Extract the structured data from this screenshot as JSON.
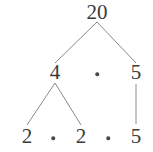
{
  "diagram": {
    "type": "factor-tree",
    "background_color": "#ffffff",
    "line_color": "#8a8a8a",
    "text_color": "#3a3a3a",
    "root_value": "20",
    "levels": [
      {
        "name": "root",
        "nodes": [
          {
            "id": "root-20",
            "label": "20",
            "kind": "number",
            "x": 97,
            "y": 12
          }
        ]
      },
      {
        "name": "level-2",
        "nodes": [
          {
            "id": "mid-4",
            "label": "4",
            "kind": "number",
            "x": 55,
            "y": 72
          },
          {
            "id": "mid-dot-1",
            "label": "·",
            "kind": "operator",
            "x": 97,
            "y": 74
          },
          {
            "id": "mid-5",
            "label": "5",
            "kind": "number",
            "x": 136,
            "y": 72
          }
        ]
      },
      {
        "name": "level-3",
        "nodes": [
          {
            "id": "leaf-2a",
            "label": "2",
            "kind": "number",
            "x": 27,
            "y": 136
          },
          {
            "id": "leaf-dot-1",
            "label": "·",
            "kind": "operator",
            "x": 53,
            "y": 138
          },
          {
            "id": "leaf-2b",
            "label": "2",
            "kind": "number",
            "x": 81,
            "y": 136
          },
          {
            "id": "leaf-dot-2",
            "label": "·",
            "kind": "operator",
            "x": 108,
            "y": 138
          },
          {
            "id": "leaf-5",
            "label": "5",
            "kind": "number",
            "x": 136,
            "y": 136
          }
        ]
      }
    ],
    "edges": [
      {
        "id": "edge-root-to-4",
        "from": "root-20",
        "to": "mid-4",
        "x1": 97,
        "y1": 22,
        "x2": 55,
        "y2": 63
      },
      {
        "id": "edge-root-to-5",
        "from": "root-20",
        "to": "mid-5",
        "x1": 97,
        "y1": 22,
        "x2": 136,
        "y2": 63
      },
      {
        "id": "edge-4-to-2a",
        "from": "mid-4",
        "to": "leaf-2a",
        "x1": 55,
        "y1": 83,
        "x2": 27,
        "y2": 125
      },
      {
        "id": "edge-4-to-2b",
        "from": "mid-4",
        "to": "leaf-2b",
        "x1": 55,
        "y1": 83,
        "x2": 81,
        "y2": 125
      },
      {
        "id": "edge-5-to-5",
        "from": "mid-5",
        "to": "leaf-5",
        "x1": 136,
        "y1": 84,
        "x2": 136,
        "y2": 124
      }
    ],
    "factorization": "20 = 4 · 5 = 2 · 2 · 5"
  }
}
